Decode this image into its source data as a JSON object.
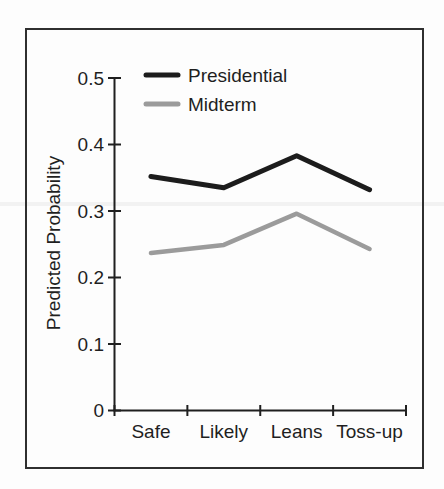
{
  "figure": {
    "background_color": "#fdfdfd",
    "frame_color": "#2f2f2f"
  },
  "chart_data": {
    "type": "line",
    "title": "",
    "xlabel": "",
    "ylabel": "Predicted Probability",
    "categories": [
      "Safe",
      "Likely",
      "Leans",
      "Toss-up"
    ],
    "series": [
      {
        "name": "Presidential",
        "color": "#1c1c1c",
        "values": [
          0.352,
          0.335,
          0.383,
          0.332
        ]
      },
      {
        "name": "Midterm",
        "color": "#9b9b9b",
        "values": [
          0.237,
          0.249,
          0.296,
          0.243
        ]
      }
    ],
    "ylim": [
      0,
      0.5
    ],
    "yticks": [
      0,
      0.1,
      0.2,
      0.3,
      0.4,
      0.5
    ],
    "ytick_labels": [
      "0",
      "0.1",
      "0.2",
      "0.3",
      "0.4",
      "0.5"
    ],
    "grid": false,
    "legend_position": "top-left-inside",
    "axis_color": "#1f1f1f",
    "text_color": "#1f1f1f"
  }
}
